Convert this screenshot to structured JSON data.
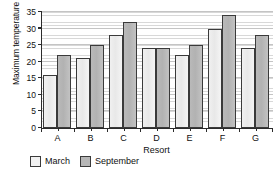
{
  "chart_data": {
    "type": "bar",
    "title": "",
    "xlabel": "Resort",
    "ylabel": "Maximum temperature (°C)",
    "categories": [
      "A",
      "B",
      "C",
      "D",
      "E",
      "F",
      "G"
    ],
    "series": [
      {
        "name": "March",
        "values": [
          16,
          21,
          28,
          24,
          22,
          30,
          24
        ],
        "color": "#f0f0f0"
      },
      {
        "name": "September",
        "values": [
          22,
          25,
          32,
          24,
          25,
          34,
          28
        ],
        "color": "#b9b9b9"
      }
    ],
    "ylim": [
      0,
      35
    ],
    "ytick_values": [
      0,
      5,
      10,
      15,
      20,
      25,
      30,
      35
    ],
    "ytick_labels": [
      "0",
      "5",
      "10",
      "15",
      "20",
      "25",
      "30",
      "35"
    ],
    "xtick_labels": [
      "A",
      "B",
      "C",
      "D",
      "E",
      "F",
      "G"
    ],
    "grid": true,
    "grid_axis": "y",
    "legend_position": "below",
    "legend_entries": [
      "March",
      "September"
    ]
  },
  "axes": {
    "y_title": "Maximum temperature (°C)",
    "x_title": "Resort",
    "y_ticks": [
      "35",
      "30",
      "25",
      "20",
      "15",
      "10",
      "5",
      "0"
    ]
  },
  "legend": {
    "items": [
      {
        "label": "March"
      },
      {
        "label": "September"
      }
    ]
  },
  "colors": {
    "march_fill": "#f0f0f0",
    "september_fill": "#b9b9b9",
    "bar_outline": "#3a3a3a",
    "axis": "#2b2b2b",
    "gridline": "#d8d8d8",
    "background": "#ffffff"
  }
}
